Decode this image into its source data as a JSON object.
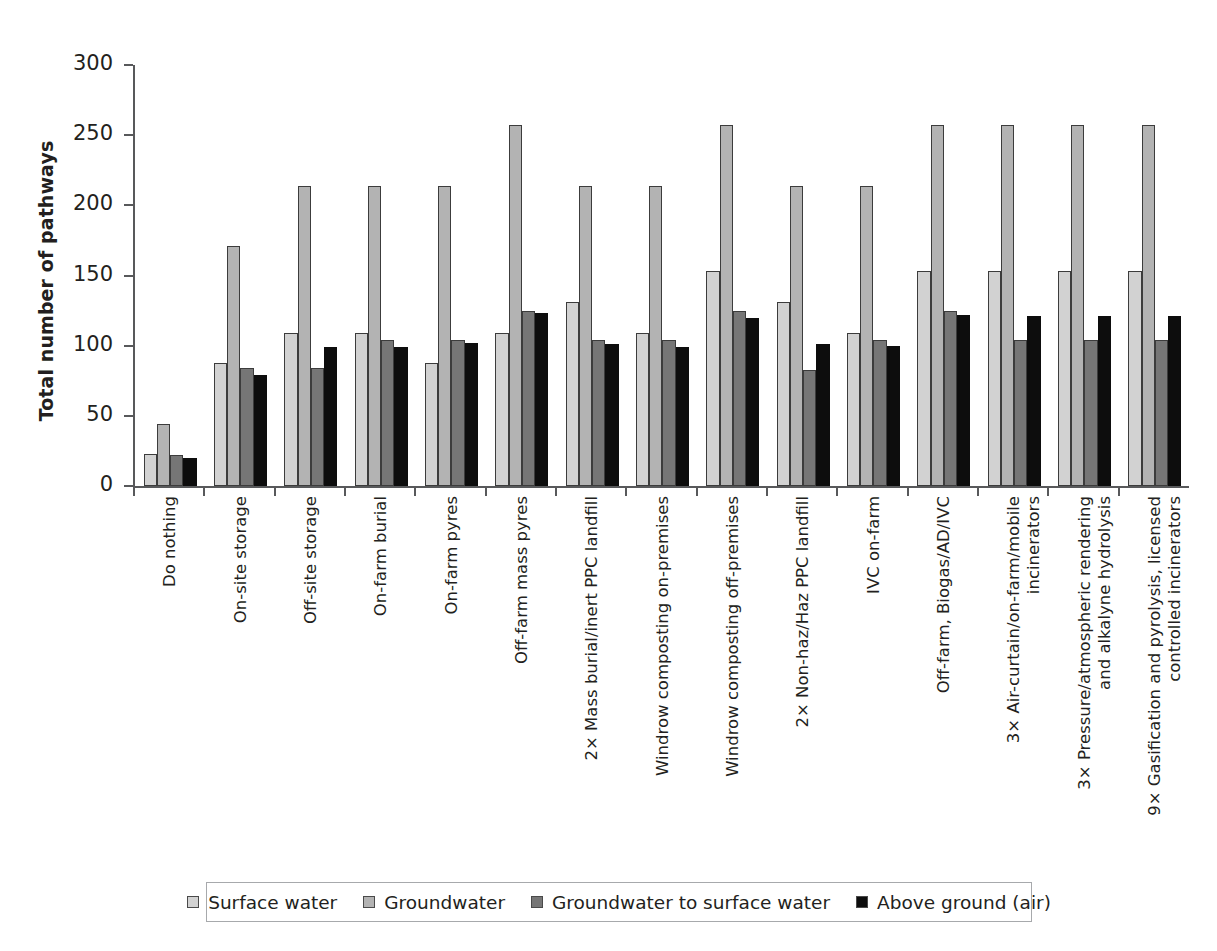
{
  "chart_data": {
    "type": "bar",
    "title": "",
    "xlabel": "",
    "ylabel": "Total number of pathways",
    "ylim": [
      0,
      300
    ],
    "yticks": [
      0,
      50,
      100,
      150,
      200,
      250,
      300
    ],
    "grid": false,
    "legend_position": "bottom",
    "categories": [
      "Do nothing",
      "On-site storage",
      "Off-site storage",
      "On-farm burial",
      "On-farm pyres",
      "Off-farm mass pyres",
      "2× Mass burial/inert PPC landfill",
      "Windrow composting on-premises",
      "Windrow composting off-premises",
      "2× Non-haz/Haz PPC landfill",
      "IVC on-farm",
      "Off-farm, Biogas/AD/IVC",
      "3× Air-curtain/on-farm/mobile\nincinerators",
      "3× Pressure/atmospheric rendering\nand alkalyne hydrolysis",
      "9× Gasification and pyrolysis, licensed\ncontrolled incinerators"
    ],
    "series": [
      {
        "name": "Surface water",
        "color": "#d2d2d2",
        "values": [
          23,
          88,
          109,
          109,
          88,
          109,
          131,
          109,
          153,
          131,
          109,
          153,
          153,
          153,
          153
        ]
      },
      {
        "name": "Groundwater",
        "color": "#b3b3b3",
        "values": [
          44,
          171,
          214,
          214,
          214,
          257,
          214,
          214,
          257,
          214,
          214,
          257,
          257,
          257,
          257
        ]
      },
      {
        "name": "Groundwater to surface water",
        "color": "#767676",
        "values": [
          22,
          84,
          84,
          104,
          104,
          125,
          104,
          104,
          125,
          83,
          104,
          125,
          104,
          104,
          104
        ]
      },
      {
        "name": "Above ground (air)",
        "color": "#0d0d0d",
        "values": [
          20,
          79,
          99,
          99,
          102,
          123,
          101,
          99,
          120,
          101,
          100,
          122,
          121,
          121,
          121
        ]
      }
    ]
  },
  "axis": {
    "y_title": "Total number of pathways",
    "tick_labels": [
      "300",
      "250",
      "200",
      "150",
      "100",
      "50",
      "0"
    ]
  },
  "legend": {
    "items": [
      {
        "label": "Surface water",
        "swatch": "legend-swatch-surface-water",
        "color": "#d2d2d2"
      },
      {
        "label": "Groundwater",
        "swatch": "legend-swatch-groundwater",
        "color": "#b3b3b3"
      },
      {
        "label": "Groundwater to surface water",
        "swatch": "legend-swatch-groundwater-to-surface-water",
        "color": "#767676"
      },
      {
        "label": "Above ground (air)",
        "swatch": "legend-swatch-above-ground-air",
        "color": "#0d0d0d"
      }
    ]
  }
}
